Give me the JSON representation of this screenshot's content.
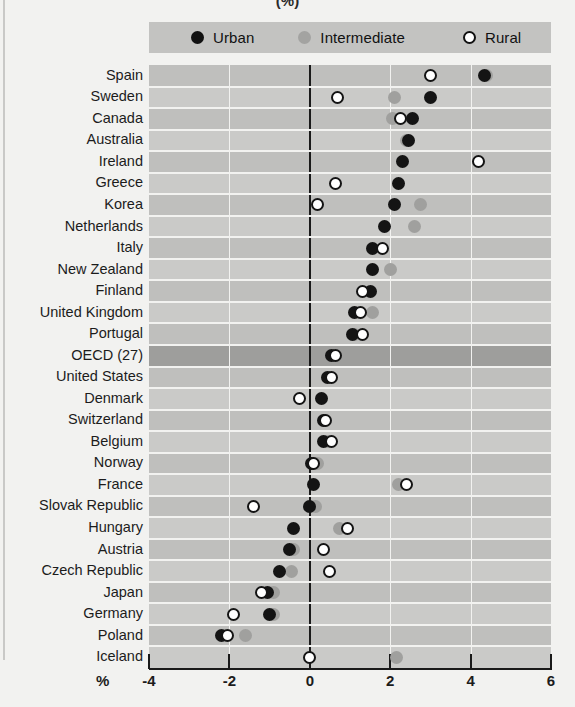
{
  "chart_title": "(%)",
  "axis_unit_label": "%",
  "legend": {
    "position": "top",
    "items": [
      {
        "label": "Urban",
        "marker": "filled-black",
        "color": "#141414"
      },
      {
        "label": "Intermediate",
        "marker": "filled-gray",
        "color": "#a0a09e"
      },
      {
        "label": "Rural",
        "marker": "open-circle",
        "color": "#ffffff"
      }
    ]
  },
  "axis": {
    "ticks": [
      "-4",
      "-2",
      "0",
      "2",
      "4",
      "6"
    ],
    "tick_values": [
      -4,
      -2,
      0,
      2,
      4,
      6
    ],
    "min": -4,
    "max": 6
  },
  "highlight_row": "OECD (27)",
  "chart_data": {
    "type": "scatter",
    "title": "(%)",
    "xlabel": "%",
    "ylabel": "",
    "xlim": [
      -4,
      6
    ],
    "grid": true,
    "legend_position": "top",
    "orientation": "horizontal",
    "categories": [
      "Spain",
      "Sweden",
      "Canada",
      "Australia",
      "Ireland",
      "Greece",
      "Korea",
      "Netherlands",
      "Italy",
      "New Zealand",
      "Finland",
      "United Kingdom",
      "Portugal",
      "OECD (27)",
      "United States",
      "Denmark",
      "Switzerland",
      "Belgium",
      "Norway",
      "France",
      "Slovak Republic",
      "Hungary",
      "Austria",
      "Czech Republic",
      "Japan",
      "Germany",
      "Poland",
      "Iceland"
    ],
    "series": [
      {
        "name": "Urban",
        "values": [
          4.35,
          3.0,
          2.55,
          2.45,
          2.3,
          2.2,
          2.1,
          1.85,
          1.55,
          1.55,
          1.5,
          1.1,
          1.05,
          0.55,
          0.45,
          0.3,
          0.35,
          0.35,
          0.05,
          0.1,
          0.0,
          -0.4,
          -0.5,
          -0.75,
          -1.05,
          -1.0,
          -2.2,
          null
        ]
      },
      {
        "name": "Intermediate",
        "values": [
          4.4,
          2.1,
          2.05,
          2.4,
          null,
          null,
          2.75,
          2.6,
          null,
          2.0,
          null,
          1.55,
          1.1,
          0.65,
          null,
          null,
          null,
          0.45,
          0.2,
          2.2,
          0.15,
          0.75,
          -0.4,
          -0.45,
          -0.9,
          -0.9,
          -1.6,
          2.15
        ]
      },
      {
        "name": "Rural",
        "values": [
          3.0,
          0.7,
          2.25,
          null,
          4.2,
          0.65,
          0.2,
          null,
          1.8,
          null,
          1.3,
          1.25,
          1.3,
          0.65,
          0.55,
          -0.25,
          0.4,
          0.55,
          0.1,
          2.4,
          -1.4,
          0.95,
          0.35,
          0.5,
          -1.2,
          -1.9,
          -2.05,
          0.0
        ]
      }
    ]
  }
}
